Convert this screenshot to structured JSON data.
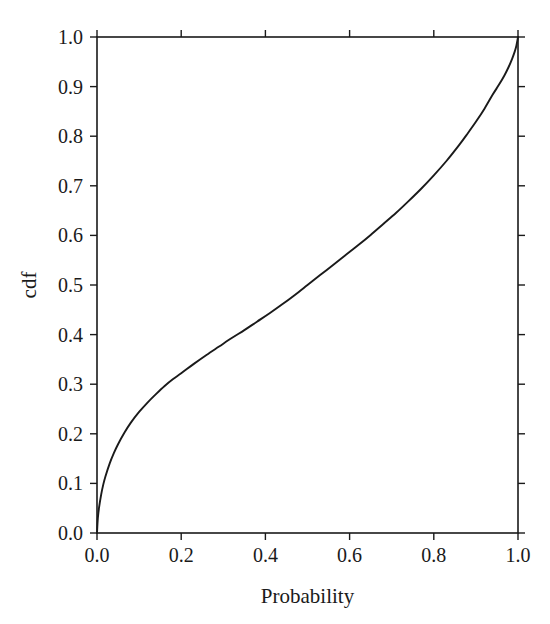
{
  "figure": {
    "background_color": "#ffffff",
    "foreground_color": "#1a1a1a"
  },
  "chart_data": {
    "type": "line",
    "title": "",
    "subtitle": "",
    "xlabel": "Probability",
    "ylabel": "cdf",
    "xlim": [
      0.0,
      1.0
    ],
    "ylim": [
      0.0,
      1.0
    ],
    "grid": false,
    "legend": null,
    "legend_position": "none",
    "annotations": [],
    "xticks": [
      0.0,
      0.2,
      0.4,
      0.6,
      0.8,
      1.0
    ],
    "xtick_labels": [
      "0.0",
      "0.2",
      "0.4",
      "0.6",
      "0.8",
      "1.0"
    ],
    "yticks": [
      0.0,
      0.1,
      0.2,
      0.3,
      0.4,
      0.5,
      0.6,
      0.7,
      0.8,
      0.9,
      1.0
    ],
    "ytick_labels": [
      "0.0",
      "0.1",
      "0.2",
      "0.3",
      "0.4",
      "0.5",
      "0.6",
      "0.7",
      "0.8",
      "0.9",
      "1.0"
    ],
    "tick_direction": "out",
    "frame": "full-box",
    "series": [
      {
        "name": "cdf",
        "color": "#1a1a1a",
        "line_width": 1.9,
        "x": [
          0.0,
          0.002,
          0.005,
          0.01,
          0.015,
          0.02,
          0.03,
          0.04,
          0.05,
          0.065,
          0.08,
          0.1,
          0.12,
          0.14,
          0.16,
          0.18,
          0.2,
          0.23,
          0.26,
          0.29,
          0.32,
          0.35,
          0.38,
          0.41,
          0.44,
          0.47,
          0.5,
          0.53,
          0.56,
          0.59,
          0.62,
          0.65,
          0.68,
          0.71,
          0.74,
          0.77,
          0.8,
          0.83,
          0.86,
          0.88,
          0.9,
          0.92,
          0.94,
          0.955,
          0.968,
          0.978,
          0.986,
          0.992,
          0.996,
          0.999,
          1.0
        ],
        "y": [
          0.0,
          0.03,
          0.052,
          0.078,
          0.098,
          0.114,
          0.14,
          0.161,
          0.179,
          0.202,
          0.222,
          0.244,
          0.263,
          0.28,
          0.296,
          0.31,
          0.322,
          0.341,
          0.359,
          0.376,
          0.393,
          0.409,
          0.426,
          0.443,
          0.461,
          0.48,
          0.5,
          0.52,
          0.54,
          0.56,
          0.58,
          0.601,
          0.623,
          0.645,
          0.669,
          0.694,
          0.721,
          0.75,
          0.782,
          0.805,
          0.829,
          0.855,
          0.884,
          0.904,
          0.923,
          0.94,
          0.956,
          0.97,
          0.982,
          0.995,
          1.0
        ]
      }
    ]
  }
}
